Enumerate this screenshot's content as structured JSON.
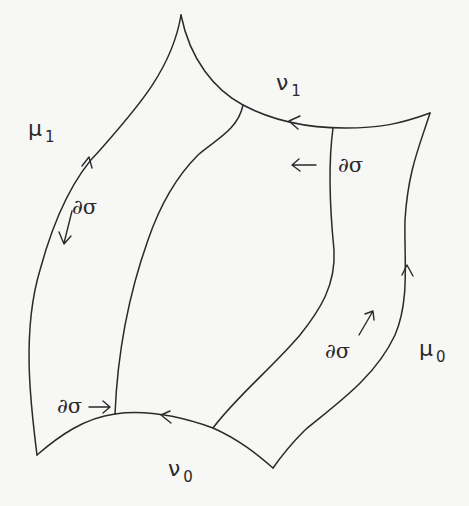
{
  "diagram": {
    "labels": {
      "mu1": {
        "base": "μ",
        "sub": "1"
      },
      "nu1": {
        "base": "ν",
        "sub": "1"
      },
      "mu0": {
        "base": "μ",
        "sub": "0"
      },
      "nu0": {
        "base": "ν",
        "sub": "0"
      }
    },
    "boundary_labels": [
      {
        "id": "left",
        "text": "∂σ"
      },
      {
        "id": "top-right",
        "text": "∂σ"
      },
      {
        "id": "bottom-left",
        "text": "∂σ"
      },
      {
        "id": "bottom-right",
        "text": "∂σ"
      }
    ],
    "colors": {
      "stroke": "#2a2a2a",
      "background": "#f7f7f5"
    }
  }
}
